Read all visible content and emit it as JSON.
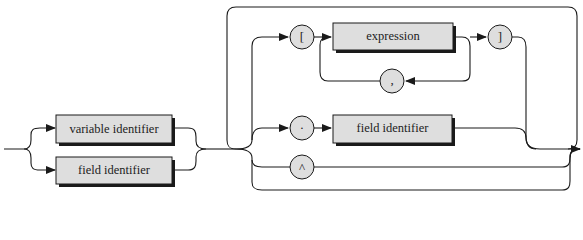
{
  "diagram": {
    "type": "syntax-diagram",
    "nonterminals": {
      "variable_identifier": "variable identifier",
      "field_identifier_entry": "field identifier",
      "expression": "expression",
      "field_identifier_selector": "field identifier"
    },
    "terminals": {
      "open_bracket": "[",
      "close_bracket": "]",
      "comma": ",",
      "dot": "·",
      "caret": "^"
    },
    "colors": {
      "box_fill": "#dedede",
      "stroke": "#1a1a1a",
      "background": "#ffffff"
    }
  }
}
